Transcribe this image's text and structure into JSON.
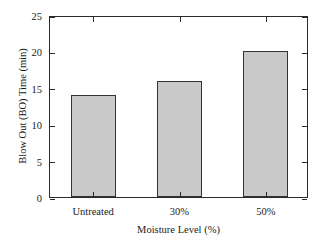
{
  "chart_data": {
    "type": "bar",
    "title": "",
    "xlabel": "Moisture Level (%)",
    "ylabel": "Blow Out (BO) Time (min)",
    "categories": [
      "Untreated",
      "30%",
      "50%"
    ],
    "values": [
      14,
      16,
      20
    ],
    "ylim": [
      0,
      25
    ],
    "ytick_labels": [
      "0",
      "5",
      "10",
      "15",
      "20",
      "25"
    ],
    "ytick_values": [
      0,
      5,
      10,
      15,
      20,
      25
    ],
    "grid": false,
    "legend": null,
    "bar_fill_color": "#c9c9c9",
    "bar_edge_color": "#333333",
    "axis_color": "#2b2b2b",
    "background_color": "#ffffff"
  }
}
